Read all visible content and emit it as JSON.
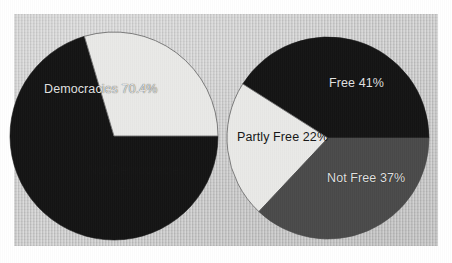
{
  "figure": {
    "background_color": "#c9c9c9",
    "page_color": "#ffffff"
  },
  "chart_data": [
    {
      "type": "pie",
      "name": "democracies-pie",
      "title": "",
      "categories": [
        "Democracies",
        "Not Democracies"
      ],
      "values": [
        70.4,
        29.6
      ],
      "value_suffix": "%",
      "colors": [
        "#141414",
        "#e9e9e7"
      ],
      "label_colors": [
        "#e2e2e2",
        "#161616"
      ],
      "legend": "none",
      "labels": [
        {
          "text": "Democracies 70.4%",
          "slice": "Democracies"
        },
        {
          "text_line1": "Not Democracies",
          "text_line2": "29.6%",
          "slice": "Not Democracies"
        }
      ],
      "geometry": {
        "center_x": 114,
        "center_y": 136,
        "radius": 104,
        "start_angle_deg": 0,
        "direction": "clockwise"
      }
    },
    {
      "type": "pie",
      "name": "freedom-pie",
      "title": "",
      "categories": [
        "Free",
        "Partly Free",
        "Not Free"
      ],
      "values": [
        41,
        22,
        37
      ],
      "value_suffix": "%",
      "colors": [
        "#141414",
        "#e9e9e7",
        "#4a4a4a"
      ],
      "label_colors": [
        "#e2e2e2",
        "#161616",
        "#e2e2e2"
      ],
      "legend": "none",
      "labels": [
        {
          "text": "Free 41%",
          "slice": "Free"
        },
        {
          "text": "Partly Free 22%",
          "slice": "Partly Free"
        },
        {
          "text": "Not Free 37%",
          "slice": "Not Free"
        }
      ],
      "geometry": {
        "center_x": 328,
        "center_y": 138,
        "radius": 101,
        "start_angle_deg": 0,
        "direction": "counterclockwise"
      }
    }
  ],
  "labels": {
    "democracies": "Democracies 70.4%",
    "not_democracies_line1": "Not Democracies",
    "not_democracies_line2": "29.6%",
    "free": "Free 41%",
    "partly_free": "Partly Free 22%",
    "not_free": "Not Free 37%"
  }
}
